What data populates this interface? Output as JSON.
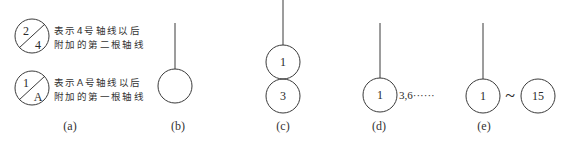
{
  "figure": {
    "a": {
      "label": "(a)",
      "symbols": [
        {
          "numerator": "2",
          "denominator": "4",
          "note_line1": "表示4号轴线以后",
          "note_line2": "附加的第二根轴线"
        },
        {
          "numerator": "1",
          "denominator": "A",
          "note_line1": "表示A号轴线以后",
          "note_line2": "附加的第一根轴线"
        }
      ]
    },
    "b": {
      "label": "(b)"
    },
    "c": {
      "label": "(c)",
      "top": "1",
      "bottom": "3"
    },
    "d": {
      "label": "(d)",
      "number": "1",
      "suffix": "3,6······"
    },
    "e": {
      "label": "(e)",
      "start": "1",
      "connector": "~",
      "end": "15"
    }
  },
  "colors": {
    "stroke": "#3a3a3a",
    "text": "#2a2a2a",
    "background": "#ffffff"
  }
}
